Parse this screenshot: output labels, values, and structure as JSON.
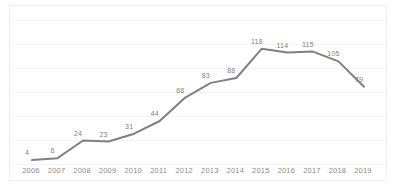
{
  "chart_data": {
    "type": "line",
    "title": "",
    "subtitle": "",
    "xlabel": "",
    "ylabel": "",
    "categories": [
      "2006",
      "2007",
      "2008",
      "2009",
      "2010",
      "2011",
      "2012",
      "2013",
      "2014",
      "2015",
      "2016",
      "2017",
      "2018",
      "2019"
    ],
    "values": [
      4,
      6,
      24,
      23,
      31,
      44,
      68,
      83,
      88,
      118,
      114,
      115,
      105,
      79
    ],
    "data_labels": [
      "4",
      "6",
      "24",
      "23",
      "31",
      "44",
      "68",
      "83",
      "88",
      "118",
      "114",
      "115",
      "105",
      "79"
    ],
    "series": [
      {
        "name": "",
        "values": [
          4,
          6,
          24,
          23,
          31,
          44,
          68,
          83,
          88,
          118,
          114,
          115,
          105,
          79
        ],
        "color": "#808080"
      }
    ],
    "ylim": [
      0,
      133
    ],
    "xlim": [
      "2006",
      "2019"
    ],
    "grid": true,
    "grid_axis": "y",
    "grid_count": 7,
    "grid_color": "#f4f4f4",
    "legend": false,
    "legend_position": "none",
    "markers": false,
    "line_width": 2,
    "line_color": "#808080",
    "label_color": "#808080",
    "tick_color": "#8c8c8c",
    "plot_background": "#ffffff",
    "border_color": "#efefef",
    "annotations": []
  }
}
